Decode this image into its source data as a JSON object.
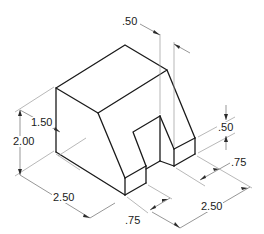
{
  "drawing": {
    "title": "Isometric view of notched block with slanted face",
    "type": "isometric technical drawing",
    "line_color": "#1a1a1a",
    "dimension_color": "#6a6a6a"
  },
  "dimensions": {
    "top_offset": ".50",
    "left_height_partial": "1.50",
    "left_height_total": "2.00",
    "right_step_height": ".50",
    "right_notch_depth": ".75",
    "bottom_left_width": "2.50",
    "bottom_front_notch": ".75",
    "bottom_right_width": "2.50"
  }
}
